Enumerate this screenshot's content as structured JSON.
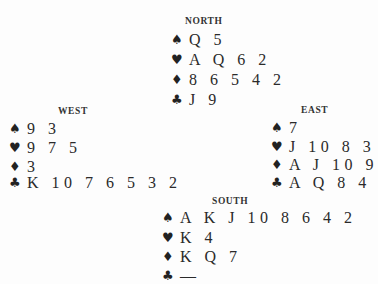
{
  "diagram": {
    "type": "bridge-deal",
    "suit_icons": {
      "spades": "♠",
      "hearts": "♥",
      "diamonds": "♦",
      "clubs": "♣"
    },
    "hands": {
      "north": {
        "label": "NORTH",
        "spades": "Q 5",
        "hearts": "A Q 6 2",
        "diamonds": "8 6 5 4 2",
        "clubs": "J 9"
      },
      "west": {
        "label": "WEST",
        "spades": "9 3",
        "hearts": "9 7 5",
        "diamonds": "3",
        "clubs": "K 10 7 6 5 3 2"
      },
      "east": {
        "label": "EAST",
        "spades": "7",
        "hearts": "J 10 8 3",
        "diamonds": "A J 10 9",
        "clubs": "A Q 8 4"
      },
      "south": {
        "label": "SOUTH",
        "spades": "A K J 10 8 6 4 2",
        "hearts": "K 4",
        "diamonds": "K Q 7",
        "clubs": "—"
      }
    }
  }
}
